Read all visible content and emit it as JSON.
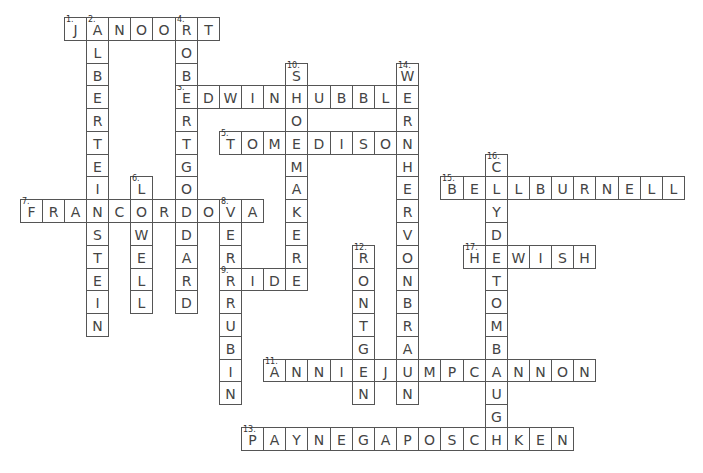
{
  "puzzle": {
    "grid": {
      "origin_x": 19.5,
      "origin_y": 17,
      "cell_w": 22.15,
      "cell_h": 22.78
    },
    "colors": {
      "border": "#555555",
      "letter": "#444444",
      "background": "#ffffff"
    },
    "entries": [
      {
        "number": "1.",
        "answer": "JANOORT",
        "direction": "across",
        "row": 0,
        "col": 2
      },
      {
        "number": "2.",
        "answer": "ALBERTEINSTEIN",
        "direction": "down",
        "row": 0,
        "col": 3
      },
      {
        "number": "3.",
        "answer": "EDWINHUBBLE",
        "direction": "across",
        "row": 3,
        "col": 7
      },
      {
        "number": "4.",
        "answer": "ROBERTGODDARD",
        "direction": "down",
        "row": 0,
        "col": 7
      },
      {
        "number": "5.",
        "answer": "TOMEDISON",
        "direction": "across",
        "row": 5,
        "col": 9
      },
      {
        "number": "6.",
        "answer": "LOWELL",
        "direction": "down",
        "row": 7,
        "col": 5
      },
      {
        "number": "7.",
        "answer": "FRANCORDOVA",
        "direction": "across",
        "row": 8,
        "col": 0
      },
      {
        "number": "8.",
        "answer": "VERARUBIN",
        "direction": "down",
        "row": 8,
        "col": 9
      },
      {
        "number": "9.",
        "answer": "RIDE",
        "direction": "across",
        "row": 11,
        "col": 9
      },
      {
        "number": "10.",
        "answer": "SHOEMAKER",
        "direction": "down",
        "row": 2,
        "col": 12
      },
      {
        "number": "11.",
        "answer": "ANNIEJUMPCANNON",
        "direction": "across",
        "row": 15,
        "col": 11
      },
      {
        "number": "12.",
        "answer": "RONTGEN",
        "direction": "down",
        "row": 10,
        "col": 15
      },
      {
        "number": "13.",
        "answer": "PAYNEGAPOSCHKEN",
        "direction": "across",
        "row": 18,
        "col": 10
      },
      {
        "number": "14.",
        "answer": "WERNHERVONBRAUN",
        "direction": "down",
        "row": 2,
        "col": 17
      },
      {
        "number": "15.",
        "answer": "BELLBURNELL",
        "direction": "across",
        "row": 7,
        "col": 19
      },
      {
        "number": "16.",
        "answer": "CLYDETOMBAUGH",
        "direction": "down",
        "row": 6,
        "col": 21
      },
      {
        "number": "17.",
        "answer": "HEWISH",
        "direction": "across",
        "row": 10,
        "col": 20
      }
    ]
  }
}
